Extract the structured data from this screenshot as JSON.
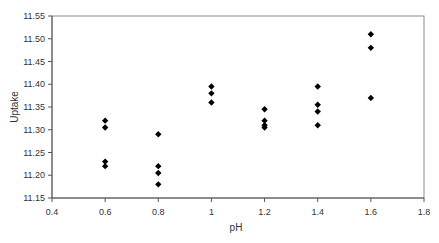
{
  "chart_data": {
    "type": "scatter",
    "title": "",
    "xlabel": "pH",
    "ylabel": "Uptake",
    "xlim": [
      0.4,
      1.8
    ],
    "ylim": [
      11.15,
      11.55
    ],
    "x_ticks": [
      0.4,
      0.6,
      0.8,
      1,
      1.2,
      1.4,
      1.6,
      1.8
    ],
    "x_tick_labels": [
      "0.4",
      "0.6",
      "0.8",
      "1",
      "1.2",
      "1.4",
      "1.6",
      "1.8"
    ],
    "y_ticks": [
      11.15,
      11.2,
      11.25,
      11.3,
      11.35,
      11.4,
      11.45,
      11.5,
      11.55
    ],
    "y_tick_labels": [
      "11.15",
      "11.20",
      "11.25",
      "11.30",
      "11.35",
      "11.40",
      "11.45",
      "11.50",
      "11.55"
    ],
    "grid": false,
    "legend": null,
    "marker": "diamond",
    "marker_color": "#000000",
    "series": [
      {
        "name": "Uptake",
        "points": [
          {
            "x": 0.6,
            "y": 11.32
          },
          {
            "x": 0.6,
            "y": 11.305
          },
          {
            "x": 0.6,
            "y": 11.23
          },
          {
            "x": 0.6,
            "y": 11.22
          },
          {
            "x": 0.8,
            "y": 11.29
          },
          {
            "x": 0.8,
            "y": 11.22
          },
          {
            "x": 0.8,
            "y": 11.205
          },
          {
            "x": 0.8,
            "y": 11.18
          },
          {
            "x": 1.0,
            "y": 11.395
          },
          {
            "x": 1.0,
            "y": 11.38
          },
          {
            "x": 1.0,
            "y": 11.36
          },
          {
            "x": 1.2,
            "y": 11.345
          },
          {
            "x": 1.2,
            "y": 11.32
          },
          {
            "x": 1.2,
            "y": 11.31
          },
          {
            "x": 1.2,
            "y": 11.305
          },
          {
            "x": 1.4,
            "y": 11.395
          },
          {
            "x": 1.4,
            "y": 11.355
          },
          {
            "x": 1.4,
            "y": 11.34
          },
          {
            "x": 1.4,
            "y": 11.31
          },
          {
            "x": 1.6,
            "y": 11.51
          },
          {
            "x": 1.6,
            "y": 11.48
          },
          {
            "x": 1.6,
            "y": 11.37
          }
        ]
      }
    ]
  },
  "labels": {
    "xlabel": "pH",
    "ylabel": "Uptake"
  }
}
